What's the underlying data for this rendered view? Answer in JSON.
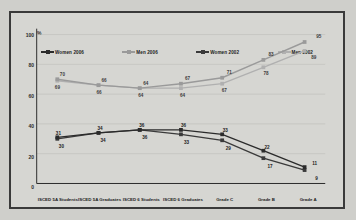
{
  "chart_data": {
    "type": "line",
    "title": "",
    "subtitle": "",
    "xlabel": "",
    "ylabel": "%",
    "ylim": [
      0,
      100
    ],
    "yticks": [
      "0",
      "20",
      "40",
      "60",
      "80",
      "100"
    ],
    "grid": true,
    "legend_position": "top",
    "categories": [
      "ISCED 5A Students",
      "ISCED 5A Graduates",
      "ISCED 6 Students",
      "ISCED 6 Graduates",
      "Grade C",
      "Grade B",
      "Grade A"
    ],
    "series": [
      {
        "name": "Women 2006",
        "color": "#2b2b2b",
        "marker": "square",
        "values": [
          31,
          34,
          36,
          36,
          33,
          22,
          11
        ]
      },
      {
        "name": "Men 2006",
        "color": "#9a9a9a",
        "marker": "square",
        "values": [
          70,
          66,
          64,
          67,
          71,
          83,
          95
        ]
      },
      {
        "name": "Women 2002",
        "color": "#3a3a3a",
        "marker": "square",
        "values": [
          30,
          34,
          36,
          33,
          29,
          17,
          9
        ]
      },
      {
        "name": "Men 2002",
        "color": "#b0b0b0",
        "marker": "square",
        "values": [
          69,
          66,
          64,
          64,
          67,
          78,
          89
        ]
      }
    ]
  },
  "axis": {
    "percent_symbol": "%"
  },
  "colors": {
    "background": "#d6d6d2",
    "border": "#3a3a3a",
    "women_2006": "#2b2b2b",
    "men_2006": "#9a9a9a",
    "women_2002": "#3a3a3a",
    "men_2002": "#b0b0b0"
  }
}
